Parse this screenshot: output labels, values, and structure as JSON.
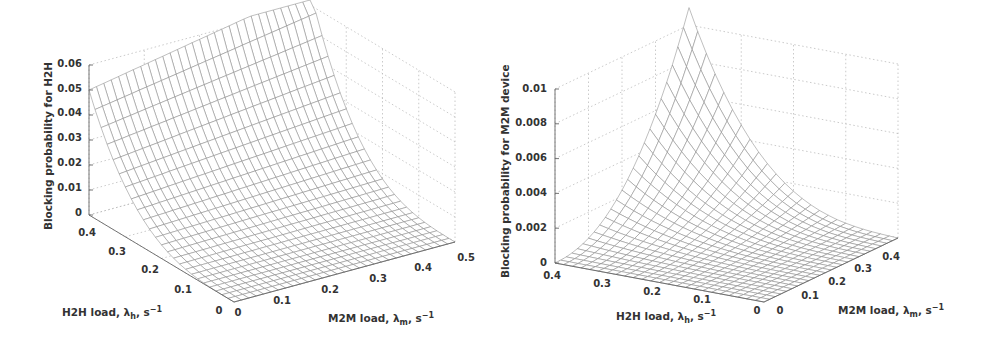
{
  "chart_data": [
    {
      "type": "surface",
      "title": "",
      "zlabel": "Blocking probability for H2H",
      "xlabel": "H2H load, λ_h, s⁻¹",
      "ylabel": "M2M load, λ_m, s⁻¹",
      "x_axis": {
        "name": "H2H load",
        "range": [
          0,
          0.4
        ],
        "ticks": [
          "0",
          "0.1",
          "0.2",
          "0.3",
          "0.4"
        ]
      },
      "y_axis": {
        "name": "M2M load",
        "range": [
          0,
          0.5
        ],
        "ticks": [
          "0",
          "0.1",
          "0.2",
          "0.3",
          "0.4",
          "0.5"
        ]
      },
      "z_axis": {
        "range": [
          0,
          0.06
        ],
        "ticks": [
          "0",
          "0.01",
          "0.02",
          "0.03",
          "0.04",
          "0.05",
          "0.06"
        ]
      },
      "grid": true,
      "surface_samples": {
        "description": "Blocking probability grows steeply with H2H load, mildly with M2M load",
        "h2h": [
          0,
          0.1,
          0.2,
          0.3,
          0.4
        ],
        "m2m_0": [
          0,
          0.0005,
          0.004,
          0.017,
          0.05
        ],
        "m2m_0.5": [
          0,
          0.002,
          0.009,
          0.027,
          0.062
        ]
      }
    },
    {
      "type": "surface",
      "title": "",
      "zlabel": "Blocking probability for M2M device",
      "xlabel": "H2H load, λ_h, s⁻¹",
      "ylabel": "M2M load, λ_m, s⁻¹",
      "x_axis": {
        "name": "H2H load",
        "range": [
          0,
          0.4
        ],
        "ticks": [
          "0",
          "0.1",
          "0.2",
          "0.3",
          "0.4"
        ]
      },
      "y_axis": {
        "name": "M2M load",
        "range": [
          0,
          0.45
        ],
        "ticks": [
          "0",
          "0.1",
          "0.2",
          "0.3",
          "0.4"
        ]
      },
      "z_axis": {
        "range": [
          0,
          0.01
        ],
        "ticks": [
          "0",
          "0.002",
          "0.004",
          "0.006",
          "0.008",
          "0.01"
        ]
      },
      "grid": true,
      "surface_samples": {
        "description": "Blocking probability of M2M devices is near zero at low load and peaks (~0.0105) at high H2H and high M2M load",
        "peak": {
          "h2h": 0.4,
          "m2m": 0.45,
          "value": 0.0105
        }
      }
    }
  ],
  "plots": {
    "left": {
      "zlabel": "Blocking probability for H2H",
      "xlabel_main": "H2H load, λ",
      "xlabel_sub": "h",
      "xlabel_unit": ", s",
      "xlabel_exp": "−1",
      "ylabel_main": "M2M load, λ",
      "ylabel_sub": "m",
      "ylabel_unit": ", s",
      "ylabel_exp": "−1",
      "zticks": [
        "0",
        "0.01",
        "0.02",
        "0.03",
        "0.04",
        "0.05",
        "0.06"
      ],
      "xticks": [
        "0",
        "0.1",
        "0.2",
        "0.3",
        "0.4"
      ],
      "yticks": [
        "0",
        "0.1",
        "0.2",
        "0.3",
        "0.4",
        "0.5"
      ]
    },
    "right": {
      "zlabel": "Blocking probability for M2M device",
      "xlabel_main": "H2H load, λ",
      "xlabel_sub": "h",
      "xlabel_unit": ", s",
      "xlabel_exp": "−1",
      "ylabel_main": "M2M load, λ",
      "ylabel_sub": "m",
      "ylabel_unit": ", s",
      "ylabel_exp": "−1",
      "zticks": [
        "0",
        "0.002",
        "0.004",
        "0.006",
        "0.008",
        "0.01"
      ],
      "xticks": [
        "0",
        "0.1",
        "0.2",
        "0.3",
        "0.4"
      ],
      "yticks": [
        "0",
        "0.1",
        "0.2",
        "0.3",
        "0.4"
      ]
    }
  }
}
